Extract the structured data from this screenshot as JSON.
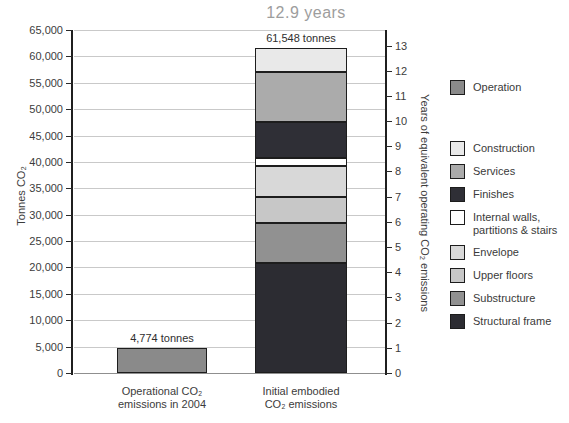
{
  "chart_data": {
    "type": "bar",
    "subtype": "stacked",
    "title": "12.9 years",
    "left_axis": {
      "label": "Tonnes CO₂",
      "min": 0,
      "max": 65000,
      "step": 5000
    },
    "right_axis": {
      "label": "Years of equivalent operating CO₂ emissions",
      "min": 0,
      "max": 13,
      "step": 1,
      "tonnes_per_year": 4774
    },
    "grid": true,
    "bars": [
      {
        "category_lines": [
          "Operational CO₂",
          "emissions in 2004"
        ],
        "total": 4774,
        "total_label": "4,774 tonnes",
        "segments": [
          {
            "name": "Operation",
            "value": 4774,
            "color": "#8a8a8a"
          }
        ]
      },
      {
        "category_lines": [
          "Initial embodied",
          "CO₂ emissions"
        ],
        "total": 61548,
        "total_label": "61,548 tonnes",
        "segments": [
          {
            "name": "Structural frame",
            "value": 20800,
            "color": "#2c2c32"
          },
          {
            "name": "Substructure",
            "value": 7600,
            "color": "#919191"
          },
          {
            "name": "Upper floors",
            "value": 5000,
            "color": "#c7c7c7"
          },
          {
            "name": "Envelope",
            "value": 5900,
            "color": "#d8d8d8"
          },
          {
            "name": "Internal walls, partitions & stairs",
            "value": 1400,
            "color": "#ffffff"
          },
          {
            "name": "Finishes",
            "value": 6900,
            "color": "#2f2f36"
          },
          {
            "name": "Services",
            "value": 9500,
            "color": "#ababab"
          },
          {
            "name": "Construction",
            "value": 4448,
            "color": "#e9e9e9"
          }
        ]
      }
    ],
    "legend": [
      {
        "label_lines": [
          "Operation"
        ],
        "color": "#8a8a8a",
        "gap_after": true
      },
      {
        "label_lines": [
          "Construction"
        ],
        "color": "#e9e9e9"
      },
      {
        "label_lines": [
          "Services"
        ],
        "color": "#ababab"
      },
      {
        "label_lines": [
          "Finishes"
        ],
        "color": "#2f2f36"
      },
      {
        "label_lines": [
          "Internal walls,",
          "partitions & stairs"
        ],
        "color": "#ffffff"
      },
      {
        "label_lines": [
          "Envelope"
        ],
        "color": "#d8d8d8"
      },
      {
        "label_lines": [
          "Upper floors"
        ],
        "color": "#c7c7c7"
      },
      {
        "label_lines": [
          "Substructure"
        ],
        "color": "#919191"
      },
      {
        "label_lines": [
          "Structural frame"
        ],
        "color": "#2c2c32"
      }
    ]
  }
}
